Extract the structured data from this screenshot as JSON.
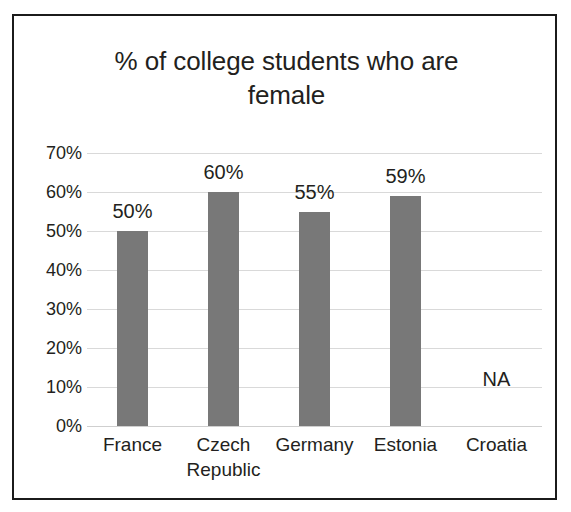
{
  "chart_data": {
    "type": "bar",
    "title": "% of college students who are\nfemale",
    "title_line1": "% of college students who are",
    "title_line2": "female",
    "xlabel": "",
    "ylabel": "",
    "categories": [
      "France",
      "Czech\nRepublic",
      "Germany",
      "Estonia",
      "Croatia"
    ],
    "values": [
      50,
      60,
      55,
      59,
      null
    ],
    "data_labels": [
      "50%",
      "60%",
      "55%",
      "59%",
      "NA"
    ],
    "ylim": [
      0,
      70
    ],
    "ytick_values": [
      70,
      60,
      50,
      40,
      30,
      20,
      10,
      0
    ],
    "ytick_labels": [
      "70%",
      "60%",
      "50%",
      "40%",
      "30%",
      "20%",
      "10%",
      "0%"
    ],
    "grid": "horizontal",
    "legend": "none",
    "annotations": [
      {
        "text": "NA",
        "category": "Croatia",
        "note": "no data available"
      }
    ],
    "series": [
      {
        "name": "% female",
        "values": [
          50,
          60,
          55,
          59,
          null
        ],
        "color": "#787878"
      }
    ],
    "bar_color": "#787878",
    "gridline_color": "#d9d9d9",
    "text_color": "#231f20",
    "frame_color": "#1b1b1b",
    "background_color": "#ffffff"
  }
}
